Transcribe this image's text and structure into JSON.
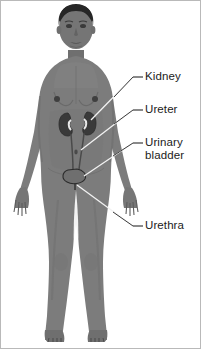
{
  "figure": {
    "background_color": "#ffffff",
    "border_color": "#b9b9b9",
    "skin_color": "#7c7c7c",
    "skin_shadow_color": "#6a6a6a",
    "skin_highlight_color": "#8d8d8d",
    "hair_color": "#2a2a2a",
    "organ_dark_color": "#3a3a3a",
    "organ_outline_color": "#2b2b2b",
    "leader_line_light_color": "#f2f2f2",
    "leader_line_dark_color": "#3d3d3d",
    "label_text_color": "#1b1b1b"
  },
  "labels": [
    {
      "id": "kidney",
      "text": "Kidney",
      "organ": "kidney",
      "dash_x": 133,
      "dash_y": 77,
      "leader_points": "133,77 145,77",
      "pointer_target": "right kidney"
    },
    {
      "id": "ureter",
      "text": "Ureter",
      "organ": "ureter",
      "dash_x": 133,
      "dash_y": 110,
      "leader_points": "133,110 145,110",
      "pointer_target": "right ureter"
    },
    {
      "id": "urinary-bladder",
      "text_line1": "Urinary",
      "text_line2": "bladder",
      "organ": "urinary bladder",
      "dash_x": 133,
      "dash_y": 143,
      "leader_points": "133,143 145,143",
      "pointer_target": "urinary bladder"
    },
    {
      "id": "urethra",
      "text": "Urethra",
      "organ": "urethra",
      "dash_x": 133,
      "dash_y": 226,
      "leader_points": "133,226 145,226",
      "pointer_target": "urethra"
    }
  ],
  "organs": [
    {
      "name": "left kidney",
      "cx": 68,
      "cy": 124,
      "rx": 7,
      "ry": 11
    },
    {
      "name": "right kidney",
      "cx": 86,
      "cy": 123,
      "rx": 7,
      "ry": 11
    },
    {
      "name": "left ureter",
      "path": "from left kidney down to bladder"
    },
    {
      "name": "right ureter",
      "path": "from right kidney down to bladder"
    },
    {
      "name": "urinary bladder",
      "cx": 76,
      "cy": 175,
      "rx": 9,
      "ry": 7
    },
    {
      "name": "urethra",
      "path": "from bladder base downward"
    }
  ]
}
